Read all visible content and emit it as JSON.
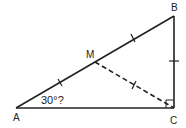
{
  "diagram": {
    "type": "geometry",
    "title": "",
    "points": {
      "A": {
        "label": "A",
        "x": 16,
        "y": 108
      },
      "B": {
        "label": "B",
        "x": 174,
        "y": 16
      },
      "C": {
        "label": "C",
        "x": 174,
        "y": 108
      },
      "M": {
        "label": "M",
        "x": 95,
        "y": 62
      }
    },
    "segments": [
      {
        "from": "A",
        "to": "B",
        "style": "solid"
      },
      {
        "from": "B",
        "to": "C",
        "style": "solid"
      },
      {
        "from": "A",
        "to": "C",
        "style": "solid"
      },
      {
        "from": "M",
        "to": "C",
        "style": "dashed"
      }
    ],
    "congruence_ticks": [
      "AM",
      "MB",
      "MC",
      "BC"
    ],
    "right_angle_at": "C",
    "angle_label": {
      "vertex": "A",
      "text": "30°?"
    },
    "colors": {
      "stroke": "#222222",
      "background": "#ffffff"
    }
  }
}
